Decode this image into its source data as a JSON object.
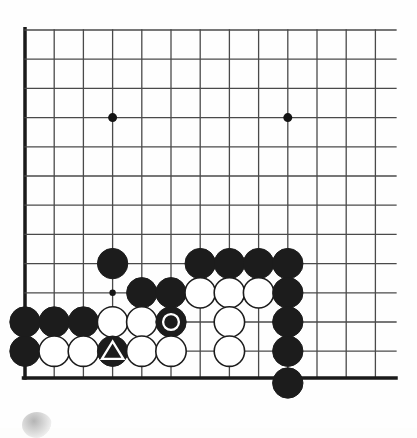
{
  "board": {
    "type": "go-board",
    "size": 19,
    "visible_region": "bottom-left corner",
    "image_width": 417,
    "image_height": 428,
    "grid": {
      "spacing": 29.2,
      "origin_x": 25,
      "origin_y": 30,
      "cols_x": [
        25,
        54.2,
        83.4,
        112.6,
        141.8,
        171,
        200.2,
        229.4,
        258.6,
        287.8,
        317,
        346.2,
        375.4
      ],
      "rows_y": [
        30,
        59.2,
        88.4,
        117.6,
        146.8,
        176,
        205.2,
        234.4,
        263.6,
        292.8,
        322,
        351.2,
        378
      ],
      "clip_right": 396,
      "edge_left": true,
      "edge_bottom": true,
      "edge_line_width": 3.5,
      "inner_line_width": 1.3,
      "line_color": "#4a4a4a",
      "edge_color": "#1a1a1a"
    },
    "star_points": [
      {
        "col": 3,
        "row": 3,
        "x": 112.6,
        "y": 117.6
      },
      {
        "col": 9,
        "row": 3,
        "x": 287.8,
        "y": 117.6
      },
      {
        "col": 3,
        "row": 9,
        "x": 112.6,
        "y": 292.8
      }
    ],
    "star_radius": 4.5,
    "small_star_radius": 3.2,
    "stone_radius": 15.2,
    "colors": {
      "black_stone": "#1c1c1c",
      "white_stone": "#ffffff",
      "white_stone_border": "#1c1c1c",
      "mark_on_black": "#ffffff",
      "mark_on_white": "#1c1c1c",
      "background": "#fefefe"
    },
    "stones": [
      {
        "id": "b1",
        "color": "black",
        "x": 112.6,
        "y": 263.6,
        "mark": "none"
      },
      {
        "id": "b2",
        "color": "black",
        "x": 200.2,
        "y": 263.6,
        "mark": "none"
      },
      {
        "id": "b3",
        "color": "black",
        "x": 229.4,
        "y": 263.6,
        "mark": "none"
      },
      {
        "id": "b4",
        "color": "black",
        "x": 258.6,
        "y": 263.6,
        "mark": "none"
      },
      {
        "id": "b5",
        "color": "black",
        "x": 287.8,
        "y": 263.6,
        "mark": "none"
      },
      {
        "id": "b6",
        "color": "black",
        "x": 141.8,
        "y": 292.8,
        "mark": "none"
      },
      {
        "id": "b7",
        "color": "black",
        "x": 171.0,
        "y": 292.8,
        "mark": "none"
      },
      {
        "id": "w1",
        "color": "white",
        "x": 200.2,
        "y": 292.8,
        "mark": "none"
      },
      {
        "id": "w2",
        "color": "white",
        "x": 229.4,
        "y": 292.8,
        "mark": "none"
      },
      {
        "id": "w3",
        "color": "white",
        "x": 258.6,
        "y": 292.8,
        "mark": "none"
      },
      {
        "id": "b8",
        "color": "black",
        "x": 287.8,
        "y": 292.8,
        "mark": "none"
      },
      {
        "id": "b9",
        "color": "black",
        "x": 25.0,
        "y": 322.0,
        "mark": "none"
      },
      {
        "id": "b10",
        "color": "black",
        "x": 54.2,
        "y": 322.0,
        "mark": "none"
      },
      {
        "id": "b11",
        "color": "black",
        "x": 83.4,
        "y": 322.0,
        "mark": "none"
      },
      {
        "id": "w4",
        "color": "white",
        "x": 112.6,
        "y": 322.0,
        "mark": "none"
      },
      {
        "id": "w5",
        "color": "white",
        "x": 141.8,
        "y": 322.0,
        "mark": "none"
      },
      {
        "id": "b12",
        "color": "black",
        "x": 171.0,
        "y": 322.0,
        "mark": "circle"
      },
      {
        "id": "w6",
        "color": "white",
        "x": 229.4,
        "y": 322.0,
        "mark": "none"
      },
      {
        "id": "b13",
        "color": "black",
        "x": 287.8,
        "y": 322.0,
        "mark": "none"
      },
      {
        "id": "b14",
        "color": "black",
        "x": 25.0,
        "y": 351.2,
        "mark": "none"
      },
      {
        "id": "w7",
        "color": "white",
        "x": 54.2,
        "y": 351.2,
        "mark": "none"
      },
      {
        "id": "w8",
        "color": "white",
        "x": 83.4,
        "y": 351.2,
        "mark": "none"
      },
      {
        "id": "b15",
        "color": "black",
        "x": 112.6,
        "y": 351.2,
        "mark": "triangle"
      },
      {
        "id": "w9",
        "color": "white",
        "x": 141.8,
        "y": 351.2,
        "mark": "none"
      },
      {
        "id": "w10",
        "color": "white",
        "x": 171.0,
        "y": 351.2,
        "mark": "none"
      },
      {
        "id": "w11",
        "color": "white",
        "x": 229.4,
        "y": 351.2,
        "mark": "none"
      },
      {
        "id": "b16",
        "color": "black",
        "x": 287.8,
        "y": 351.2,
        "mark": "none"
      },
      {
        "id": "b17",
        "color": "black",
        "x": 287.8,
        "y": 383.0,
        "mark": "none"
      }
    ],
    "marks_legend": {
      "circle": "marked white circle on black stone",
      "triangle": "marked white triangle on black stone"
    }
  },
  "artifact": {
    "name": "scan-smudge",
    "x": 22,
    "y": 412,
    "width": 30,
    "height": 26
  }
}
